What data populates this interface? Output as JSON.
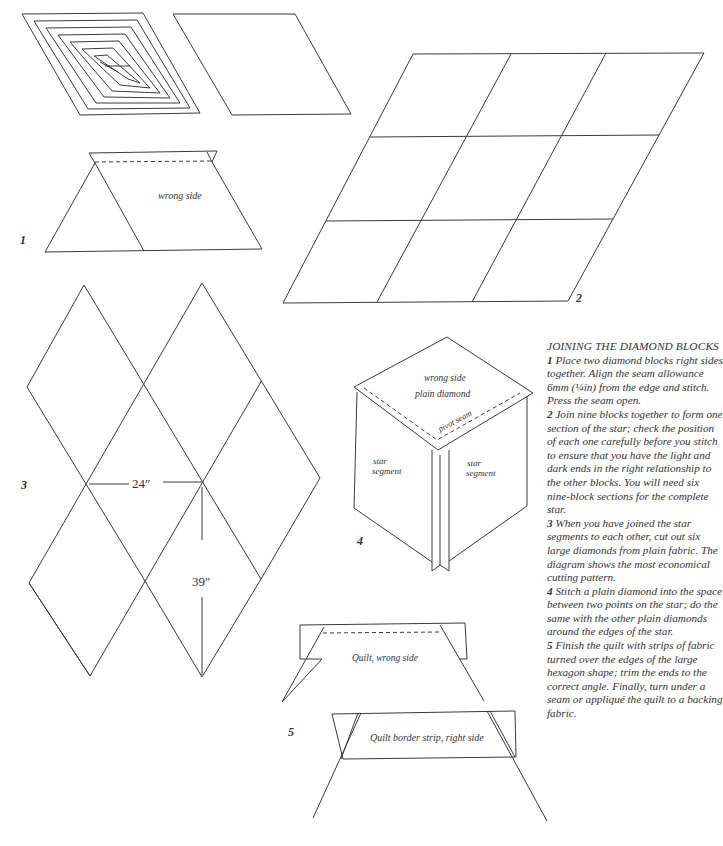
{
  "figure_labels": {
    "fig1": "1",
    "fig2": "2",
    "fig3": "3",
    "fig4": "4",
    "fig5": "5"
  },
  "figure1": {
    "wrong_side": "wrong side"
  },
  "figure3": {
    "width_measure": "24″",
    "height_measure": "39″"
  },
  "figure4": {
    "wrong_side": "wrong side",
    "plain_diamond": "plain diamond",
    "pivot_seam": "pivot seam",
    "star_segment_left_1": "star",
    "star_segment_left_2": "segment",
    "star_segment_right_1": "star",
    "star_segment_right_2": "segment"
  },
  "figure5": {
    "quilt_wrong_side": "Quilt, wrong side",
    "border_strip": "Quilt border strip, right side"
  },
  "instructions": {
    "heading": "Joining the diamond blocks",
    "steps": [
      {
        "num": "1",
        "text": "Place two diamond blocks right sides together. Align the seam allowance 6mm (¼in) from the edge and stitch. Press the seam open."
      },
      {
        "num": "2",
        "text": "Join nine blocks together to form one section of the star; check the position of each one carefully before you stitch to ensure that you have the light and dark ends in the right relationship to the other blocks. You will need six nine-block sections for the complete star."
      },
      {
        "num": "3",
        "text": "When you have joined the star segments to each other, cut out six large diamonds from plain fabric. The diagram shows the most economical cutting pattern."
      },
      {
        "num": "4",
        "text": "Stitch a plain diamond into the space between two points on the star; do the same with the other plain diamonds around the edges of the star."
      },
      {
        "num": "5",
        "text": "Finish the quilt with strips of fabric turned over the edges of the large hexagon shape; trim the ends to the correct angle. Finally, turn under a seam or appliqué the quilt to a backing fabric."
      }
    ]
  }
}
